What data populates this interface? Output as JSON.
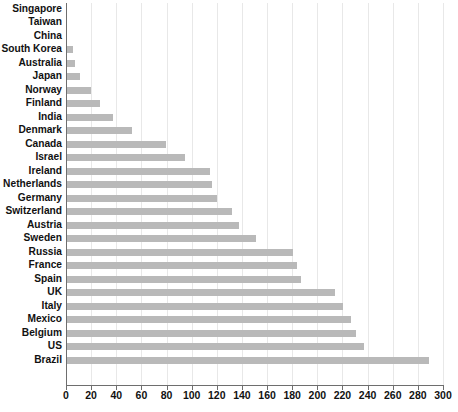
{
  "chart_data": {
    "type": "bar",
    "orientation": "horizontal",
    "title": "",
    "subtitle": "",
    "xlabel": "",
    "ylabel": "",
    "xlim": [
      0,
      300
    ],
    "ylim": null,
    "grid": "vertical",
    "legend": "none",
    "bar_color": "#b9b9b9",
    "axis_color": "#6e6e6e",
    "gridline_color": "#e8e8e8",
    "x_ticks": [
      0,
      20,
      40,
      60,
      80,
      100,
      120,
      140,
      160,
      180,
      200,
      220,
      240,
      260,
      280,
      300
    ],
    "x_tick_labels": [
      "0",
      "20",
      "40",
      "60",
      "80",
      "100",
      "120",
      "140",
      "160",
      "180",
      "200",
      "220",
      "240",
      "260",
      "280",
      "300"
    ],
    "categories": [
      "Singapore",
      "Taiwan",
      "China",
      "South Korea",
      "Australia",
      "Japan",
      "Norway",
      "Finland",
      "India",
      "Denmark",
      "Canada",
      "Israel",
      "Ireland",
      "Netherlands",
      "Germany",
      "Switzerland",
      "Austria",
      "Sweden",
      "Russia",
      "France",
      "Spain",
      "UK",
      "Italy",
      "Mexico",
      "Belgium",
      "US",
      "Brazil"
    ],
    "values": [
      0,
      0,
      0,
      5,
      6,
      10,
      19,
      26,
      37,
      52,
      79,
      94,
      114,
      115,
      119,
      131,
      137,
      150,
      180,
      183,
      186,
      213,
      220,
      226,
      230,
      236,
      288
    ]
  }
}
